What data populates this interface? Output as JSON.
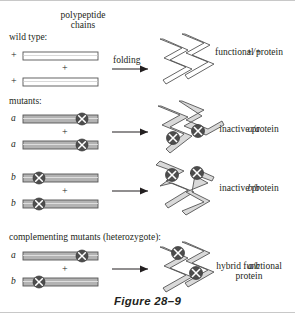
{
  "figure": {
    "caption": "Figure 28–9",
    "header": {
      "line1": "polypeptide",
      "line2": "chains"
    },
    "folding_label": "folding",
    "colors": {
      "chain_outline": "#555555",
      "chain_fill_wild": "#ffffff",
      "chain_fill_mutant": "#b3b3b3",
      "marker_fill": "#4d4d4d",
      "marker_cross": "#ffffff",
      "arrow": "#231f20",
      "text": "#231f20",
      "border": "#c8c8c8"
    }
  },
  "sections": [
    {
      "id": "wild-type",
      "title": "wild type:",
      "chain_top_label": "+",
      "chain_bottom_label": "+",
      "plus": "+",
      "arrow_label": "folding",
      "chains_mutated": false,
      "result_genotype": "+/+",
      "result_line1": "functional protein",
      "result_line2": ""
    },
    {
      "id": "mutants-aa",
      "title": "mutants:",
      "chain_top_label": "a",
      "chain_bottom_label": "a",
      "plus": "+",
      "arrow_label": "",
      "chains_mutated": true,
      "result_genotype": "a/a",
      "result_line1": "inactive protein",
      "result_line2": ""
    },
    {
      "id": "mutants-bb",
      "title": "",
      "chain_top_label": "b",
      "chain_bottom_label": "b",
      "plus": "+",
      "arrow_label": "",
      "chains_mutated": true,
      "result_genotype": "b/b",
      "result_line1": "inactive protein",
      "result_line2": ""
    },
    {
      "id": "heterozygote-ab",
      "title": "complementing mutants (heterozygote):",
      "chain_top_label": "a",
      "chain_bottom_label": "b",
      "plus": "+",
      "arrow_label": "",
      "chains_mutated": true,
      "result_genotype": "a/b",
      "result_line1": "hybrid functional",
      "result_line2": "protein"
    }
  ]
}
